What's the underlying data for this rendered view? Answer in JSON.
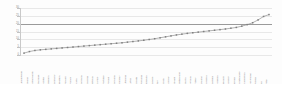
{
  "figure": {
    "background_color": "#fdfdfd",
    "plot_area_color": "#ffffff",
    "axis_color": "#c9c9c9",
    "grid_color": "#e8e8e8",
    "series_color": "#7f7f7f",
    "reference_line_color": "#9a9a9a",
    "tick_label_color": "#8d8d8d"
  },
  "chart_data": {
    "type": "line",
    "title": "",
    "subtitle": "",
    "xlabel": "",
    "ylabel": "",
    "grid": true,
    "legend": "none",
    "ylim": [
      0,
      30
    ],
    "yticks": [
      0,
      5,
      10,
      15,
      20,
      25,
      30
    ],
    "ytick_labels": [
      "0",
      "5",
      "10",
      "15",
      "20",
      "25",
      "30"
    ],
    "annotations": [
      {
        "kind": "reference-line",
        "orientation": "horizontal",
        "value": 20,
        "label": ""
      }
    ],
    "series": [
      {
        "name": "Value",
        "marker": "square",
        "values": [
          1.2,
          2.2,
          2.9,
          3.3,
          3.6,
          3.9,
          4.2,
          4.5,
          4.8,
          5.1,
          5.4,
          5.7,
          6.0,
          6.3,
          6.6,
          6.9,
          7.2,
          7.5,
          7.8,
          8.2,
          8.6,
          9.0,
          9.4,
          9.9,
          10.4,
          11.0,
          11.6,
          12.2,
          12.8,
          13.3,
          13.8,
          14.2,
          14.6,
          15.0,
          15.4,
          15.8,
          16.2,
          16.6,
          17.1,
          17.6,
          18.4,
          19.4,
          20.6,
          22.4,
          24.6,
          25.8
        ]
      }
    ],
    "categories": [
      "Luxembourg",
      "Ireland",
      "Netherlands",
      "Denmark",
      "Austria",
      "Sweden",
      "Germany",
      "Belgium",
      "Finland",
      "France",
      "Malta",
      "Slovenia",
      "Czechia",
      "Estonia",
      "Cyprus",
      "Portugal",
      "Poland",
      "Slovakia",
      "Hungary",
      "Lithuania",
      "Latvia",
      "Croatia",
      "Romania",
      "Bulgaria",
      "Greece",
      "Italy",
      "Spain",
      "Norway",
      "Iceland",
      "Switzerland",
      "Serbia",
      "Albania",
      "Turkey",
      "Ukraine",
      "Moldova",
      "Georgia",
      "Armenia",
      "Belarus",
      "Kosovo",
      "Bosnia",
      "Montenegro",
      "Macedonia",
      "Azerbaijan",
      "Russia",
      "EU",
      "Total"
    ]
  }
}
